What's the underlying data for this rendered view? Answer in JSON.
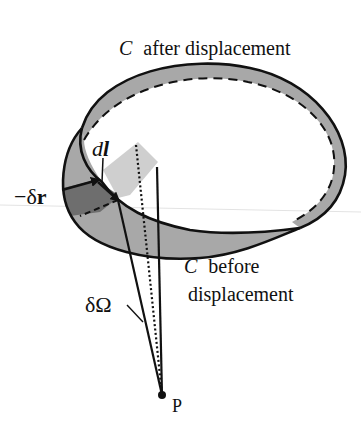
{
  "diagram": {
    "colors": {
      "ink": "#111111",
      "band_fill": "#a8a8a8",
      "patch_dark": "#6e6e6e",
      "patch_light": "#cfcfcf",
      "background": "#ffffff"
    },
    "labels": {
      "after_symbol": "C",
      "after_text": "after displacement",
      "before_symbol": "C",
      "before_text_line1": "before",
      "before_text_line2": "displacement",
      "dl_d": "d",
      "dl_l": "l",
      "delta_r_prefix": "−δ",
      "delta_r_r": "r",
      "delta_omega": "δΩ",
      "point": "P"
    }
  }
}
